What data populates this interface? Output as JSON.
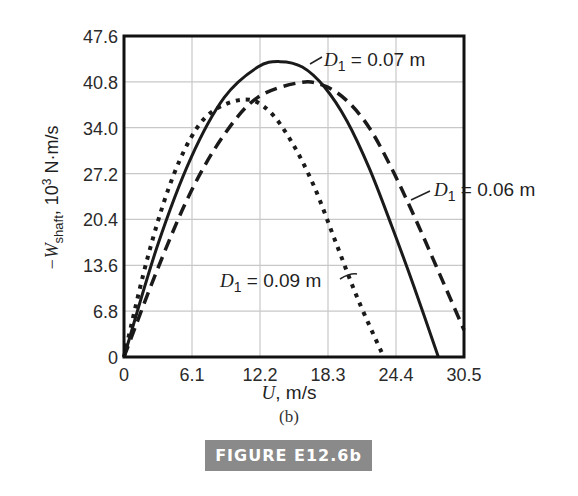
{
  "chart_data": {
    "type": "line",
    "title": "",
    "subtitle": "(b)",
    "caption": "FIGURE E12.6b",
    "xlabel": "U, m/s",
    "ylabel": "−W_shaft, 10^3 N·m/s",
    "xlim": [
      0,
      30.5
    ],
    "ylim": [
      0,
      47.6
    ],
    "x_ticks": [
      "0",
      "6.1",
      "12.2",
      "18.3",
      "24.4",
      "30.5"
    ],
    "y_ticks": [
      "0",
      "6.8",
      "13.6",
      "20.4",
      "27.2",
      "34.0",
      "40.8",
      "47.6"
    ],
    "grid": true,
    "legend_position": "inline annotations",
    "series": [
      {
        "name": "D1 = 0.07 m",
        "style": "solid",
        "x": [
          0,
          3,
          6,
          9,
          12,
          14,
          16,
          18,
          20,
          22,
          24,
          26,
          28.2
        ],
        "y": [
          0,
          16.5,
          29.5,
          38.5,
          43.0,
          43.8,
          43.0,
          40.0,
          35.0,
          28.0,
          19.5,
          10.5,
          0
        ]
      },
      {
        "name": "D1 = 0.06 m",
        "style": "dashed",
        "x": [
          0,
          3,
          6,
          9,
          12,
          15.8,
          18,
          20,
          22,
          24,
          26,
          28,
          30.5
        ],
        "y": [
          0,
          13.0,
          24.5,
          33.0,
          38.5,
          40.7,
          40.2,
          38.0,
          34.0,
          28.0,
          21.0,
          13.5,
          4.0
        ]
      },
      {
        "name": "D1 = 0.09 m",
        "style": "dotted",
        "x": [
          0,
          2,
          4,
          6,
          8,
          10.9,
          13,
          15,
          17,
          19,
          21,
          23.3
        ],
        "y": [
          0,
          14.0,
          25.0,
          32.5,
          36.5,
          38.2,
          36.5,
          32.0,
          25.5,
          17.0,
          8.5,
          0
        ]
      }
    ]
  },
  "labels": {
    "y_axis_prefix": "−W",
    "y_axis_sub": "shaft",
    "y_axis_suffix": ", 10",
    "y_axis_sup": "3",
    "y_axis_unit": " N·m/s",
    "x_axis_var": "U",
    "x_axis_unit": ", m/s",
    "subfigure": "(b)",
    "figure_caption": "FIGURE E12.6b",
    "annotations": [
      {
        "var": "D",
        "sub": "1",
        "text": " = 0.07 m"
      },
      {
        "var": "D",
        "sub": "1",
        "text": " = 0.06 m"
      },
      {
        "var": "D",
        "sub": "1",
        "text": " = 0.09 m"
      }
    ]
  }
}
